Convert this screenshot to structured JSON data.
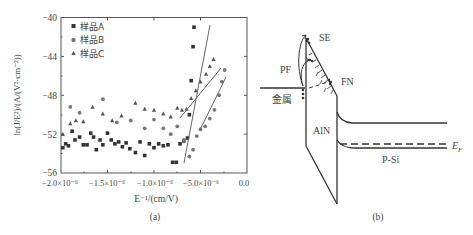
{
  "panel_a": {
    "caption": "(a)",
    "legend": [
      {
        "marker": "square",
        "label": "样品A"
      },
      {
        "marker": "circle",
        "label": "样品B"
      },
      {
        "marker": "triangle",
        "label": "样品C"
      }
    ],
    "ylabel": "ln(J/E²)/(A/(V²·cm⁻²))",
    "xlabel": "E⁻¹/(cm/V)",
    "yticks": [
      "−40",
      "−44",
      "−48",
      "−52",
      "−56"
    ],
    "xticks": [
      "−2.0×10⁻⁶",
      "−1.5×10⁻⁶",
      "−1.0×10⁻⁶",
      "−5.0×10⁻⁶",
      "0.0"
    ]
  },
  "panel_b": {
    "caption": "(b)",
    "labels": {
      "se": "SE",
      "pf": "PF",
      "fn": "FN",
      "metal": "金属",
      "aln": "AlN",
      "psi": "P-Si",
      "ef": "E",
      "ef_sub": "F"
    }
  },
  "chart_data": [
    {
      "type": "scatter",
      "title": "",
      "xlabel": "E⁻¹/(cm/V)",
      "ylabel": "ln(J/E²)/(A/(V²·cm⁻²))",
      "xlim": [
        -2e-06,
        0.0
      ],
      "ylim": [
        -56,
        -40
      ],
      "x_tick_labels": [
        "−2.0×10⁻⁶",
        "−1.5×10⁻⁶",
        "−1.0×10⁻⁶",
        "−5.0×10⁻⁶",
        "0.0"
      ],
      "y_tick_labels": [
        "−40",
        "−44",
        "−48",
        "−52",
        "−56"
      ],
      "legend_position": "upper left",
      "grid": false,
      "series": [
        {
          "name": "样品A",
          "marker": "square",
          "points": [
            [
              -1.98e-06,
              -53.4
            ],
            [
              -1.95e-06,
              -53.0
            ],
            [
              -1.92e-06,
              -53.2
            ],
            [
              -1.88e-06,
              -51.7
            ],
            [
              -1.85e-06,
              -52.6
            ],
            [
              -1.8e-06,
              -52.3
            ],
            [
              -1.76e-06,
              -53.1
            ],
            [
              -1.72e-06,
              -53.1
            ],
            [
              -1.68e-06,
              -51.9
            ],
            [
              -1.65e-06,
              -52.3
            ],
            [
              -1.62e-06,
              -53.6
            ],
            [
              -1.58e-06,
              -52.6
            ],
            [
              -1.55e-06,
              -53.1
            ],
            [
              -1.5e-06,
              -51.9
            ],
            [
              -1.46e-06,
              -52.6
            ],
            [
              -1.42e-06,
              -53.0
            ],
            [
              -1.38e-06,
              -52.8
            ],
            [
              -1.34e-06,
              -53.3
            ],
            [
              -1.3e-06,
              -52.9
            ],
            [
              -1.26e-06,
              -53.5
            ],
            [
              -1.2e-06,
              -53.9
            ],
            [
              -1.15e-06,
              -52.8
            ],
            [
              -1.1e-06,
              -54.2
            ],
            [
              -1.05e-06,
              -53.0
            ],
            [
              -1e-06,
              -53.4
            ],
            [
              -9.5e-07,
              -53.0
            ],
            [
              -9e-07,
              -53.2
            ],
            [
              -8.5e-07,
              -53.1
            ],
            [
              -8e-07,
              -54.9
            ],
            [
              -7.6e-07,
              -54.9
            ],
            [
              -7.2e-07,
              -53.0
            ],
            [
              -6.8e-07,
              -52.7
            ],
            [
              -6.4e-07,
              -52.4
            ],
            [
              -6.2e-07,
              -50.0
            ],
            [
              -6e-07,
              -46.5
            ],
            [
              -5.8e-07,
              -43.0
            ],
            [
              -5.7e-07,
              -41.0
            ]
          ]
        },
        {
          "name": "样品B",
          "marker": "circle",
          "points": [
            [
              -1.9e-06,
              -49.2
            ],
            [
              -1.8e-06,
              -49.8
            ],
            [
              -1.55e-06,
              -48.4
            ],
            [
              -1.4e-06,
              -50.8
            ],
            [
              -1.25e-06,
              -50.6
            ],
            [
              -1.1e-06,
              -51.4
            ],
            [
              -1e-06,
              -50.5
            ],
            [
              -9e-07,
              -51.4
            ],
            [
              -8.2e-07,
              -52.0
            ],
            [
              -7.5e-07,
              -51.2
            ],
            [
              -6.8e-07,
              -52.6
            ],
            [
              -6.2e-07,
              -54.3
            ],
            [
              -5.8e-07,
              -53.6
            ],
            [
              -5.4e-07,
              -52.2
            ],
            [
              -5e-07,
              -51.5
            ],
            [
              -4.5e-07,
              -51.2
            ],
            [
              -4e-07,
              -50.4
            ],
            [
              -3.5e-07,
              -49.5
            ],
            [
              -3e-07,
              -48.0
            ],
            [
              -2.7e-07,
              -46.6
            ],
            [
              -2.4e-07,
              -45.4
            ]
          ]
        },
        {
          "name": "样品C",
          "marker": "triangle",
          "points": [
            [
              -1.98e-06,
              -52.0
            ],
            [
              -1.9e-06,
              -50.9
            ],
            [
              -1.84e-06,
              -50.6
            ],
            [
              -1.76e-06,
              -50.7
            ],
            [
              -1.66e-06,
              -49.2
            ],
            [
              -1.55e-06,
              -49.9
            ],
            [
              -1.45e-06,
              -50.6
            ],
            [
              -1.35e-06,
              -50.1
            ],
            [
              -1.2e-06,
              -48.8
            ],
            [
              -1.1e-06,
              -49.4
            ],
            [
              -1e-06,
              -49.5
            ],
            [
              -9e-07,
              -49.9
            ],
            [
              -8.2e-07,
              -50.2
            ],
            [
              -7.5e-07,
              -49.3
            ],
            [
              -7e-07,
              -49.5
            ],
            [
              -6.5e-07,
              -49.4
            ],
            [
              -6e-07,
              -48.3
            ],
            [
              -5.5e-07,
              -47.5
            ],
            [
              -5e-07,
              -46.6
            ],
            [
              -4.4e-07,
              -45.8
            ],
            [
              -4e-07,
              -45.0
            ],
            [
              -3.6e-07,
              -44.3
            ]
          ]
        }
      ]
    }
  ]
}
